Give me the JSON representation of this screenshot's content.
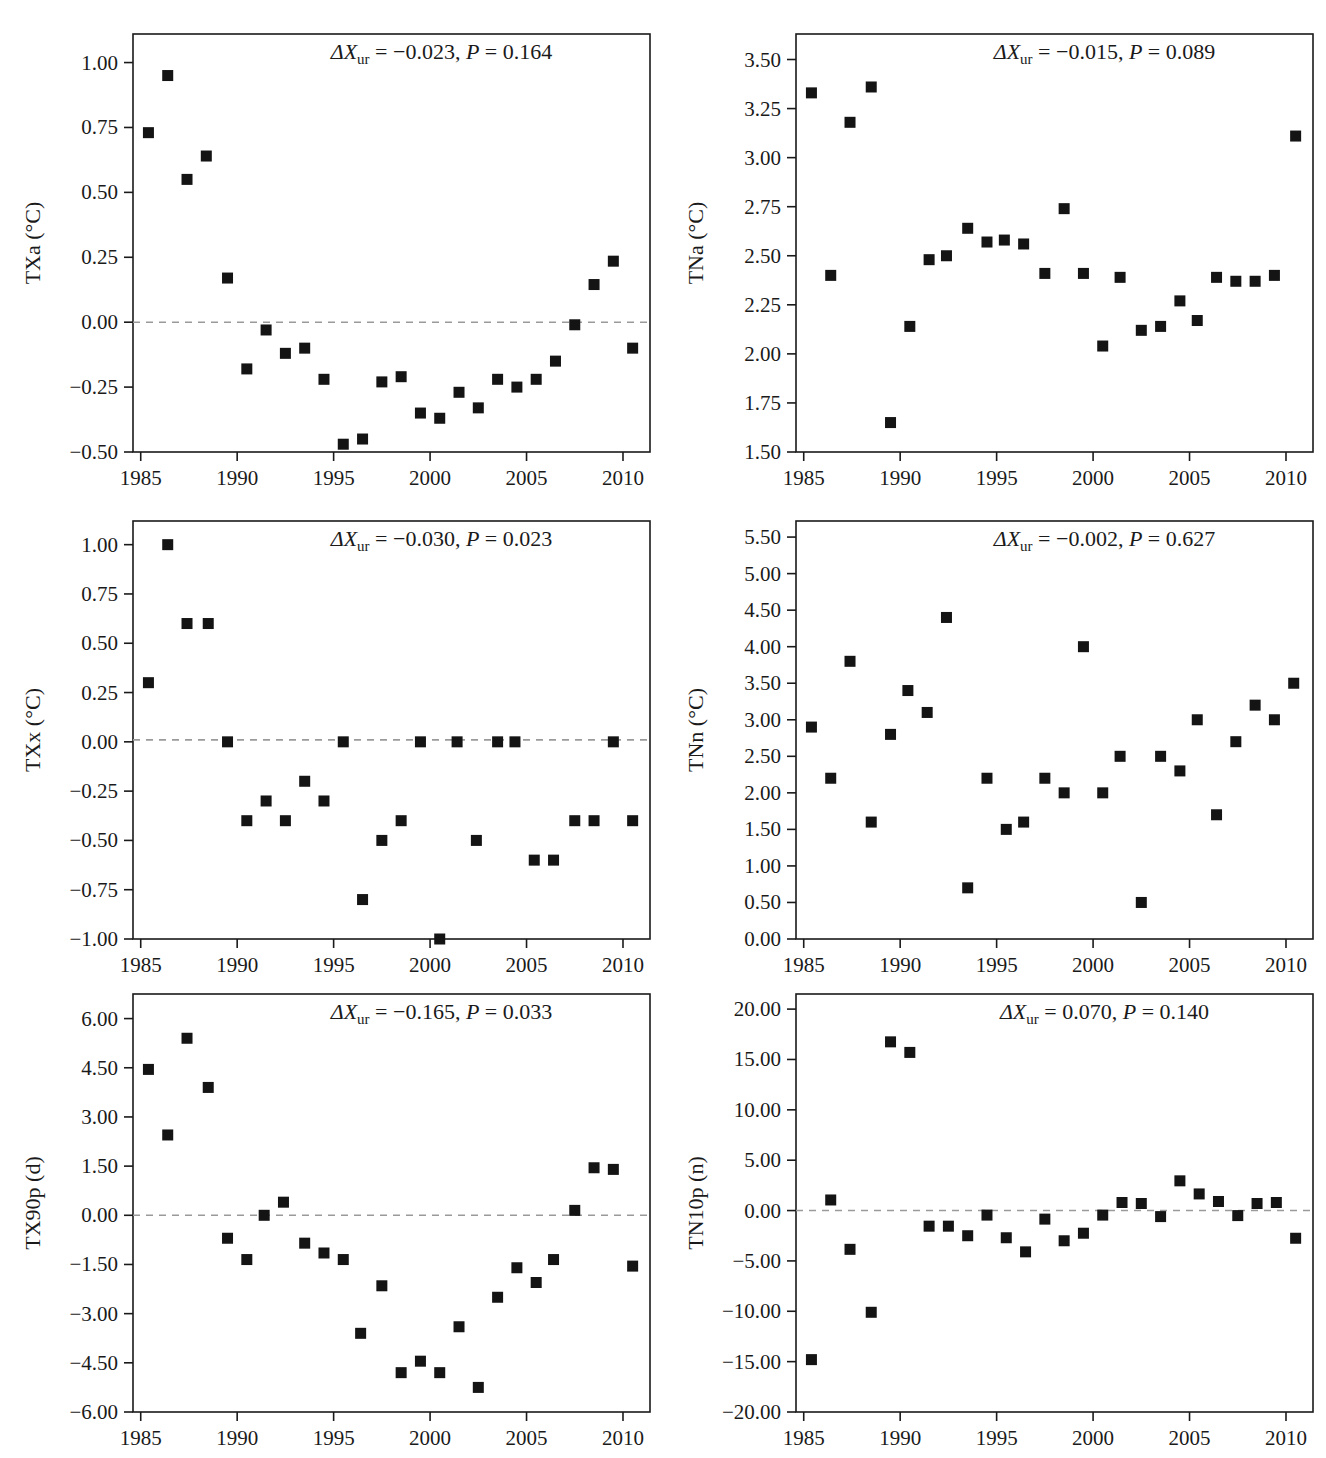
{
  "figure": {
    "panel_count": 6,
    "marker_color": "#141414",
    "zeroline_color": "#9a9a9a",
    "axis_color": "#1a1a1a"
  },
  "chart_data": [
    {
      "type": "scatter",
      "id": "txa",
      "title": "",
      "xlabel": "",
      "ylabel": "TXa (°C)",
      "ylabel_symbol": "TXa",
      "ylabel_unit": "(°C)",
      "xlim": [
        1984.6,
        2011.4
      ],
      "ylim": [
        -0.5,
        1.11
      ],
      "xticks": [
        1985,
        1990,
        1995,
        2000,
        2005,
        2010
      ],
      "xtick_labels": [
        "1985",
        "1990",
        "1995",
        "2000",
        "2005",
        "2010"
      ],
      "yticks": [
        -0.5,
        -0.25,
        0.0,
        0.25,
        0.5,
        0.75,
        1.0
      ],
      "ytick_labels": [
        "−0.50",
        "−0.25",
        "0.00",
        "0.25",
        "0.50",
        "0.75",
        "1.00"
      ],
      "zeroline": 0.0,
      "grid": false,
      "annotation": {
        "delta_symbol": "ΔX",
        "subscript": "ur",
        "delta_value": "−0.023",
        "p_symbol": "P",
        "p_value": "0.164",
        "text": "ΔXur = −0.023, P = 0.164"
      },
      "x": [
        1985.4,
        1986.4,
        1987.4,
        1988.4,
        1989.5,
        1990.5,
        1991.5,
        1992.5,
        1993.5,
        1994.5,
        1995.5,
        1996.5,
        1997.5,
        1998.5,
        1999.5,
        2000.5,
        2001.5,
        2002.5,
        2003.5,
        2004.5,
        2005.5,
        2006.5,
        2007.5,
        2008.5,
        2009.5,
        2010.5
      ],
      "y": [
        0.73,
        0.95,
        0.55,
        0.64,
        0.17,
        -0.18,
        -0.03,
        -0.12,
        -0.1,
        -0.22,
        -0.47,
        -0.45,
        -0.23,
        -0.21,
        -0.35,
        -0.37,
        -0.27,
        -0.33,
        -0.22,
        -0.25,
        -0.22,
        -0.15,
        -0.01,
        0.145,
        0.235,
        -0.1
      ]
    },
    {
      "type": "scatter",
      "id": "tna",
      "title": "",
      "xlabel": "",
      "ylabel": "TNa (°C)",
      "ylabel_symbol": "TNa",
      "ylabel_unit": "(°C)",
      "xlim": [
        1984.6,
        2011.4
      ],
      "ylim": [
        1.5,
        3.63
      ],
      "xticks": [
        1985,
        1990,
        1995,
        2000,
        2005,
        2010
      ],
      "xtick_labels": [
        "1985",
        "1990",
        "1995",
        "2000",
        "2005",
        "2010"
      ],
      "yticks": [
        1.5,
        1.75,
        2.0,
        2.25,
        2.5,
        2.75,
        3.0,
        3.25,
        3.5
      ],
      "ytick_labels": [
        "1.50",
        "1.75",
        "2.00",
        "2.25",
        "2.50",
        "2.75",
        "3.00",
        "3.25",
        "3.50"
      ],
      "zeroline": null,
      "grid": false,
      "annotation": {
        "delta_symbol": "ΔX",
        "subscript": "ur",
        "delta_value": "−0.015",
        "p_symbol": "P",
        "p_value": "0.089",
        "text": "ΔXur = −0.015, P = 0.089"
      },
      "x": [
        1985.4,
        1986.4,
        1987.4,
        1988.5,
        1989.5,
        1990.5,
        1991.5,
        1992.4,
        1993.5,
        1994.5,
        1995.4,
        1996.4,
        1997.5,
        1998.5,
        1999.5,
        2000.5,
        2001.4,
        2002.5,
        2003.5,
        2004.5,
        2005.4,
        2006.4,
        2007.4,
        2008.4,
        2009.4,
        2010.5
      ],
      "y": [
        3.33,
        2.4,
        3.18,
        3.36,
        1.65,
        2.14,
        2.48,
        2.5,
        2.64,
        2.57,
        2.58,
        2.56,
        2.41,
        2.74,
        2.41,
        2.04,
        2.39,
        2.12,
        2.14,
        2.27,
        2.17,
        2.39,
        2.37,
        2.37,
        2.4,
        3.11
      ]
    },
    {
      "type": "scatter",
      "id": "txx",
      "title": "",
      "xlabel": "",
      "ylabel": "TXx (°C)",
      "ylabel_symbol": "TXx",
      "ylabel_unit": "(°C)",
      "xlim": [
        1984.6,
        2011.4
      ],
      "ylim": [
        -1.0,
        1.12
      ],
      "xticks": [
        1985,
        1990,
        1995,
        2000,
        2005,
        2010
      ],
      "xtick_labels": [
        "1985",
        "1990",
        "1995",
        "2000",
        "2005",
        "2010"
      ],
      "yticks": [
        -1.0,
        -0.75,
        -0.5,
        -0.25,
        0.0,
        0.25,
        0.5,
        0.75,
        1.0
      ],
      "ytick_labels": [
        "−1.00",
        "−0.75",
        "−0.50",
        "−0.25",
        "0.00",
        "0.25",
        "0.50",
        "0.75",
        "1.00"
      ],
      "zeroline": 0.01,
      "grid": false,
      "annotation": {
        "delta_symbol": "ΔX",
        "subscript": "ur",
        "delta_value": "−0.030",
        "p_symbol": "P",
        "p_value": "0.023",
        "text": "ΔXur = −0.030, P = 0.023"
      },
      "x": [
        1985.4,
        1986.4,
        1987.4,
        1988.5,
        1989.5,
        1990.5,
        1991.5,
        1992.5,
        1993.5,
        1994.5,
        1995.5,
        1996.5,
        1997.5,
        1998.5,
        1999.5,
        2000.5,
        2001.4,
        2002.4,
        2003.5,
        2004.4,
        2005.4,
        2006.4,
        2007.5,
        2008.5,
        2009.5,
        2010.5
      ],
      "y": [
        0.3,
        1.0,
        0.6,
        0.6,
        0.0,
        -0.4,
        -0.3,
        -0.4,
        -0.2,
        -0.3,
        0.0,
        -0.8,
        -0.5,
        -0.4,
        0.0,
        -1.0,
        0.0,
        -0.5,
        0.0,
        0.0,
        -0.6,
        -0.6,
        -0.4,
        -0.4,
        0.0,
        -0.4
      ]
    },
    {
      "type": "scatter",
      "id": "tnn",
      "title": "",
      "xlabel": "",
      "ylabel": "TNn (°C)",
      "ylabel_symbol": "TNn",
      "ylabel_unit": "(°C)",
      "xlim": [
        1984.6,
        2011.4
      ],
      "ylim": [
        0.0,
        5.72
      ],
      "xticks": [
        1985,
        1990,
        1995,
        2000,
        2005,
        2010
      ],
      "xtick_labels": [
        "1985",
        "1990",
        "1995",
        "2000",
        "2005",
        "2010"
      ],
      "yticks": [
        0.0,
        0.5,
        1.0,
        1.5,
        2.0,
        2.5,
        3.0,
        3.5,
        4.0,
        4.5,
        5.0,
        5.5
      ],
      "ytick_labels": [
        "0.00",
        "0.50",
        "1.00",
        "1.50",
        "2.00",
        "2.50",
        "3.00",
        "3.50",
        "4.00",
        "4.50",
        "5.00",
        "5.50"
      ],
      "zeroline": null,
      "grid": false,
      "annotation": {
        "delta_symbol": "ΔX",
        "subscript": "ur",
        "delta_value": "−0.002",
        "p_symbol": "P",
        "p_value": "0.627",
        "text": "ΔXur = −0.002, P = 0.627"
      },
      "x": [
        1985.4,
        1986.4,
        1987.4,
        1988.5,
        1989.5,
        1990.4,
        1991.4,
        1992.4,
        1993.5,
        1994.5,
        1995.5,
        1996.4,
        1997.5,
        1998.5,
        1999.5,
        2000.5,
        2001.4,
        2002.5,
        2003.5,
        2004.5,
        2005.4,
        2006.4,
        2007.4,
        2008.4,
        2009.4,
        2010.4
      ],
      "y": [
        2.9,
        2.2,
        3.8,
        1.6,
        2.8,
        3.4,
        3.1,
        4.4,
        0.7,
        2.2,
        1.5,
        1.6,
        2.2,
        2.0,
        4.0,
        2.0,
        2.5,
        0.5,
        2.5,
        2.3,
        3.0,
        1.7,
        2.7,
        3.2,
        3.0,
        3.5
      ]
    },
    {
      "type": "scatter",
      "id": "tx90p",
      "title": "",
      "xlabel": "",
      "ylabel": "TX90p (d)",
      "ylabel_symbol": "TX90p",
      "ylabel_unit": "(d)",
      "xlim": [
        1984.6,
        2011.4
      ],
      "ylim": [
        -6.0,
        6.75
      ],
      "xticks": [
        1985,
        1990,
        1995,
        2000,
        2005,
        2010
      ],
      "xtick_labels": [
        "1985",
        "1990",
        "1995",
        "2000",
        "2005",
        "2010"
      ],
      "yticks": [
        -6.0,
        -4.5,
        -3.0,
        -1.5,
        0.0,
        1.5,
        3.0,
        4.5,
        6.0
      ],
      "ytick_labels": [
        "−6.00",
        "−4.50",
        "−3.00",
        "−1.50",
        "0.00",
        "1.50",
        "3.00",
        "4.50",
        "6.00"
      ],
      "zeroline": 0.0,
      "grid": false,
      "annotation": {
        "delta_symbol": "ΔX",
        "subscript": "ur",
        "delta_value": "−0.165",
        "p_symbol": "P",
        "p_value": "0.033",
        "text": "ΔXur = −0.165, P = 0.033"
      },
      "x": [
        1985.4,
        1986.4,
        1987.4,
        1988.5,
        1989.5,
        1990.5,
        1991.4,
        1992.4,
        1993.5,
        1994.5,
        1995.5,
        1996.4,
        1997.5,
        1998.5,
        1999.5,
        2000.5,
        2001.5,
        2002.5,
        2003.5,
        2004.5,
        2005.5,
        2006.4,
        2007.5,
        2008.5,
        2009.5,
        2010.5
      ],
      "y": [
        4.45,
        2.45,
        5.4,
        3.9,
        -0.7,
        -1.35,
        0.0,
        0.4,
        -0.85,
        -1.15,
        -1.35,
        -3.6,
        -2.15,
        -4.8,
        -4.45,
        -4.8,
        -3.4,
        -5.25,
        -2.5,
        -1.6,
        -2.05,
        -1.35,
        0.15,
        1.45,
        1.4,
        -1.55
      ]
    },
    {
      "type": "scatter",
      "id": "tn10p",
      "title": "",
      "xlabel": "",
      "ylabel": "TN10p (n)",
      "ylabel_symbol": "TN10p",
      "ylabel_unit": "(n)",
      "xlim": [
        1984.6,
        2011.4
      ],
      "ylim": [
        -20.0,
        21.5
      ],
      "xticks": [
        1985,
        1990,
        1995,
        2000,
        2005,
        2010
      ],
      "xtick_labels": [
        "1985",
        "1990",
        "1995",
        "2000",
        "2005",
        "2010"
      ],
      "yticks": [
        -20.0,
        -15.0,
        -10.0,
        -5.0,
        0.0,
        5.0,
        10.0,
        15.0,
        20.0
      ],
      "ytick_labels": [
        "−20.00",
        "−15.00",
        "−10.00",
        "−5.00",
        "0.00",
        "5.00",
        "10.00",
        "15.00",
        "20.00"
      ],
      "zeroline": 0.0,
      "grid": false,
      "annotation": {
        "delta_symbol": "ΔX",
        "subscript": "ur",
        "delta_value": "0.070",
        "p_symbol": "P",
        "p_value": "0.140",
        "text": "ΔXur = 0.070, P = 0.140"
      },
      "x": [
        1985.4,
        1986.4,
        1987.4,
        1988.5,
        1989.5,
        1990.5,
        1991.5,
        1992.5,
        1993.5,
        1994.5,
        1995.5,
        1996.5,
        1997.5,
        1998.5,
        1999.5,
        2000.5,
        2001.5,
        2002.5,
        2003.5,
        2004.5,
        2005.5,
        2006.5,
        2007.5,
        2008.5,
        2009.5,
        2010.5
      ],
      "y": [
        -14.8,
        1.05,
        -3.85,
        -10.1,
        16.75,
        15.7,
        -1.55,
        -1.55,
        -2.5,
        -0.45,
        -2.7,
        -4.1,
        -0.85,
        -3.0,
        -2.25,
        -0.45,
        0.8,
        0.7,
        -0.6,
        2.95,
        1.65,
        0.9,
        -0.5,
        0.7,
        0.8,
        -2.75
      ]
    }
  ]
}
